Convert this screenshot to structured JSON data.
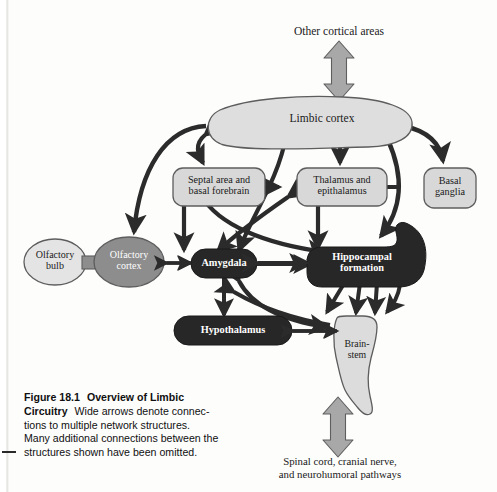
{
  "figure": {
    "number": "Figure 18.1",
    "title": "Overview of Limbic Circuitry",
    "caption_body": "Wide arrows denote connections to multiple network structures. Many additional connections between the structures shown have been omitted.",
    "caption_line_1_bold": "Figure 18.1",
    "caption_line_1_title": "Overview of Limbic",
    "caption_line_2_title": "Circuitry",
    "caption_line_2_body": "Wide arrows denote connec-",
    "caption_line_3": "tions to multiple network structures.",
    "caption_line_4": "Many additional connections between the",
    "caption_line_5": "structures shown have been omitted."
  },
  "external_labels": {
    "top": "Other cortical areas",
    "bottom_line_1": "Spinal cord, cranial nerve,",
    "bottom_line_2": "and neurohumoral pathways"
  },
  "nodes": [
    {
      "id": "limbic_cortex",
      "label": "Limbic cortex",
      "shape": "arc",
      "fill": "#dedede",
      "text": "dark"
    },
    {
      "id": "septal",
      "label": "Septal area and\nbasal forebrain",
      "shape": "rounded",
      "fill": "#d8d8d8",
      "text": "dark"
    },
    {
      "id": "thalamus",
      "label": "Thalamus and\nepithalamus",
      "shape": "rounded",
      "fill": "#d8d8d8",
      "text": "dark"
    },
    {
      "id": "basal_ganglia",
      "label": "Basal\nganglia",
      "shape": "rounded",
      "fill": "#d8d8d8",
      "text": "dark"
    },
    {
      "id": "olfactory_bulb",
      "label": "Olfactory\nbulb",
      "shape": "ellipse",
      "fill": "#e4e4e4",
      "text": "dark"
    },
    {
      "id": "olfactory_cortex",
      "label": "Olfactory\ncortex",
      "shape": "ellipse",
      "fill": "#8d8d8d",
      "text": "light"
    },
    {
      "id": "amygdala",
      "label": "Amygdala",
      "shape": "rounded",
      "fill": "#272727",
      "text": "light"
    },
    {
      "id": "hippocampus",
      "label": "Hippocampal\nformation",
      "shape": "hook",
      "fill": "#272727",
      "text": "light"
    },
    {
      "id": "hypothalamus",
      "label": "Hypothalamus",
      "shape": "rounded",
      "fill": "#272727",
      "text": "light"
    },
    {
      "id": "brainstem",
      "label": "Brain-\nstem",
      "shape": "organic",
      "fill": "#dcdcdc",
      "text": "dark"
    }
  ],
  "wide_arrows": [
    {
      "id": "top-wide-arrow",
      "from": "Other cortical areas",
      "to": "Limbic cortex",
      "direction": "bidirectional",
      "fill": "#a8a8a8"
    },
    {
      "id": "bottom-wide-arrow",
      "from": "Brain-stem",
      "to": "Spinal cord, cranial nerve, and neurohumoral pathways",
      "direction": "bidirectional",
      "fill": "#a8a8a8"
    }
  ],
  "connections": [
    {
      "from": "limbic_cortex",
      "to": "olfactory_cortex",
      "direction": "one-way"
    },
    {
      "from": "limbic_cortex",
      "to": "septal",
      "direction": "bidirectional"
    },
    {
      "from": "limbic_cortex",
      "to": "thalamus",
      "direction": "bidirectional"
    },
    {
      "from": "limbic_cortex",
      "to": "basal_ganglia",
      "direction": "one-way"
    },
    {
      "from": "limbic_cortex",
      "to": "amygdala",
      "direction": "bidirectional"
    },
    {
      "from": "limbic_cortex",
      "to": "hippocampus",
      "direction": "bidirectional"
    },
    {
      "from": "septal",
      "to": "thalamus",
      "direction": "bidirectional"
    },
    {
      "from": "septal",
      "to": "amygdala",
      "direction": "bidirectional"
    },
    {
      "from": "septal",
      "to": "hippocampus",
      "direction": "bidirectional"
    },
    {
      "from": "basal_ganglia",
      "to": "thalamus",
      "direction": "one-way"
    },
    {
      "from": "thalamus",
      "to": "hippocampus",
      "direction": "bidirectional"
    },
    {
      "from": "thalamus",
      "to": "amygdala",
      "direction": "bidirectional"
    },
    {
      "from": "olfactory_bulb",
      "to": "olfactory_cortex",
      "direction": "link"
    },
    {
      "from": "olfactory_cortex",
      "to": "amygdala",
      "direction": "bidirectional"
    },
    {
      "from": "amygdala",
      "to": "hippocampus",
      "direction": "bidirectional"
    },
    {
      "from": "amygdala",
      "to": "hypothalamus",
      "direction": "bidirectional"
    },
    {
      "from": "amygdala",
      "to": "brainstem",
      "direction": "bidirectional"
    },
    {
      "from": "hippocampus",
      "to": "brainstem",
      "direction": "bidirectional"
    },
    {
      "from": "hypothalamus",
      "to": "brainstem",
      "direction": "bidirectional"
    }
  ],
  "colors": {
    "stroke": "#2b2b2b",
    "dark_node": "#272727",
    "light_node": "#d8d8d8",
    "mid_node": "#8d8d8d",
    "wide_arrow": "#a8a8a8",
    "page": "#fdfdfc"
  },
  "geometry": {
    "limbic_cortex": {
      "x": 212,
      "y": 105,
      "w": 200,
      "h": 42
    },
    "septal": {
      "x": 173,
      "y": 168,
      "w": 92,
      "h": 38
    },
    "thalamus": {
      "x": 297,
      "y": 168,
      "w": 90,
      "h": 38
    },
    "basal_ganglia": {
      "x": 424,
      "y": 168,
      "w": 52,
      "h": 40
    },
    "olfactory_bulb": {
      "x": 55,
      "y": 258,
      "w": 62,
      "h": 46
    },
    "olfactory_cortex": {
      "x": 128,
      "y": 258,
      "w": 70,
      "h": 48
    },
    "amygdala": {
      "x": 222,
      "y": 263,
      "w": 88,
      "h": 30
    },
    "hippocampus": {
      "x": 370,
      "y": 262,
      "w": 120,
      "h": 44
    },
    "hypothalamus": {
      "x": 229,
      "y": 327,
      "w": 110,
      "h": 29
    },
    "brainstem": {
      "x": 345,
      "y": 345,
      "w": 52,
      "h": 90
    }
  }
}
